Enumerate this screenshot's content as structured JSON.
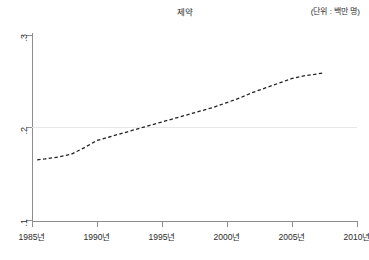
{
  "header": {
    "title": "제약",
    "unit_label": "(단위 : 백만 명)"
  },
  "axes": {
    "y_ticks": [
      {
        "label": ".3",
        "value": 0.3
      },
      {
        "label": ".2",
        "value": 0.2
      },
      {
        "label": ".1",
        "value": 0.1
      }
    ],
    "x_ticks": [
      {
        "label": "1985년",
        "value": 1985
      },
      {
        "label": "1990년",
        "value": 1990
      },
      {
        "label": "1995년",
        "value": 1995
      },
      {
        "label": "2000년",
        "value": 2000
      },
      {
        "label": "2005년",
        "value": 2005
      },
      {
        "label": "2010년",
        "value": 2010
      }
    ]
  },
  "chart_data": {
    "type": "line",
    "title": "제약",
    "subtitle": "(단위 : 백만 명)",
    "xlabel": "",
    "ylabel": "",
    "xlim": [
      1985,
      2010
    ],
    "ylim": [
      0.1,
      0.3
    ],
    "grid": true,
    "gridlines_y": [
      0.2
    ],
    "legend": null,
    "line_style": "dashed",
    "line_color": "#222222",
    "series": [
      {
        "name": "제약",
        "x": [
          1985.4,
          1986,
          1987,
          1988,
          1989,
          1990,
          1991,
          1992,
          1993,
          1994,
          1995,
          1996,
          1997,
          1998,
          1999,
          2000,
          2001,
          2002,
          2003,
          2004,
          2005,
          2006,
          2007,
          2007.4
        ],
        "values": [
          0.165,
          0.166,
          0.168,
          0.171,
          0.178,
          0.186,
          0.19,
          0.194,
          0.198,
          0.202,
          0.206,
          0.21,
          0.214,
          0.218,
          0.222,
          0.227,
          0.232,
          0.238,
          0.243,
          0.248,
          0.253,
          0.256,
          0.258,
          0.259
        ]
      }
    ]
  }
}
